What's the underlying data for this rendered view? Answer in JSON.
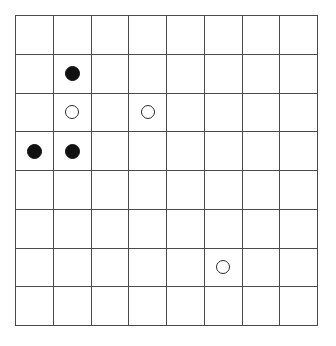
{
  "board": {
    "title": "8x8 grid board with stones",
    "columns": 8,
    "rows": 8,
    "grid_line_color": "#4a4a4a",
    "background_color": "#ffffff",
    "black_stone_color": "#111111",
    "white_stone_fill": "#ffffff",
    "white_stone_border": "#2b2b2b",
    "empty_label": "",
    "stone_labels": {
      "black": "black-stone",
      "white": "white-stone",
      "empty": "empty-cell"
    },
    "cells": [
      [
        "",
        "",
        "",
        "",
        "",
        "",
        "",
        ""
      ],
      [
        "",
        "black",
        "",
        "",
        "",
        "",
        "",
        ""
      ],
      [
        "",
        "white",
        "",
        "white",
        "",
        "",
        "",
        ""
      ],
      [
        "black",
        "black",
        "",
        "",
        "",
        "",
        "",
        ""
      ],
      [
        "",
        "",
        "",
        "",
        "",
        "",
        "",
        ""
      ],
      [
        "",
        "",
        "",
        "",
        "",
        "",
        "",
        ""
      ],
      [
        "",
        "",
        "",
        "",
        "",
        "white",
        "",
        ""
      ],
      [
        "",
        "",
        "",
        "",
        "",
        "",
        "",
        ""
      ]
    ],
    "stones": [
      {
        "color": "black",
        "col": 1,
        "row": 1
      },
      {
        "color": "white",
        "col": 1,
        "row": 2
      },
      {
        "color": "white",
        "col": 3,
        "row": 2
      },
      {
        "color": "black",
        "col": 0,
        "row": 3
      },
      {
        "color": "black",
        "col": 1,
        "row": 3
      },
      {
        "color": "white",
        "col": 5,
        "row": 6
      }
    ],
    "counts": {
      "black": 3,
      "white": 3,
      "total_cells": 64
    }
  }
}
